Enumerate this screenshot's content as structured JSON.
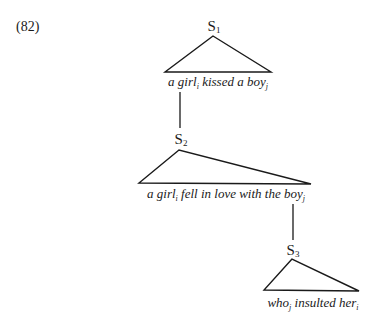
{
  "example_number": "(82)",
  "nodes": [
    {
      "label": "S",
      "sub": "1"
    },
    {
      "label": "S",
      "sub": "2"
    },
    {
      "label": "S",
      "sub": "3"
    }
  ],
  "phrases": [
    {
      "parts": [
        {
          "t": "a girl"
        },
        {
          "s": "i"
        },
        {
          "t": " kissed a boy"
        },
        {
          "s": "j"
        }
      ]
    },
    {
      "parts": [
        {
          "t": "a girl"
        },
        {
          "s": "i"
        },
        {
          "t": " fell in love with the boy"
        },
        {
          "s": "j"
        }
      ]
    },
    {
      "parts": [
        {
          "t": "who"
        },
        {
          "s": "j"
        },
        {
          "t": " insulted her"
        },
        {
          "s": "i"
        }
      ]
    }
  ],
  "phrase_text": {
    "p1_a": "a girl",
    "p1_i": "i",
    "p1_b": " kissed a boy",
    "p1_j": "j",
    "p2_a": "a girl",
    "p2_i": "i",
    "p2_b": " fell in love with the boy",
    "p2_j": "j",
    "p3_a": "who",
    "p3_j": "j",
    "p3_b": " insulted her",
    "p3_i": "i"
  }
}
